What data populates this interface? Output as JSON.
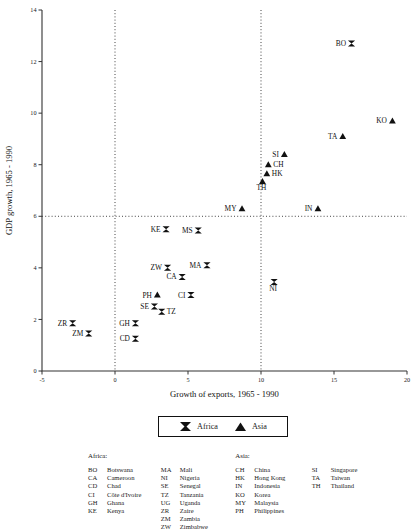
{
  "chart_data": {
    "type": "scatter",
    "title": "",
    "xlabel": "Growth of exports, 1965 - 1990",
    "ylabel": "GDP growth, 1965 - 1990",
    "xlim": [
      -5,
      20
    ],
    "ylim": [
      0,
      14
    ],
    "xticks": [
      -5,
      0,
      5,
      10,
      15,
      20
    ],
    "yticks": [
      0,
      2,
      4,
      6,
      8,
      10,
      12,
      14
    ],
    "grid": false,
    "reference_lines": {
      "vertical": [
        0,
        10
      ],
      "horizontal": [
        6
      ]
    },
    "legend_position": "below-axes",
    "series": [
      {
        "name": "Africa",
        "marker": "bowtie",
        "color": "#111111",
        "points": [
          {
            "code": "BO",
            "label": "Botswana",
            "x": 16.2,
            "y": 12.7,
            "label_side": "left"
          },
          {
            "code": "NI",
            "label": "Nigeria",
            "x": 10.9,
            "y": 3.45,
            "label_side": "below"
          },
          {
            "code": "MS",
            "label": "Mali",
            "x": 5.7,
            "y": 5.45,
            "label_side": "left"
          },
          {
            "code": "KE",
            "label": "Kenya",
            "x": 3.5,
            "y": 5.5,
            "label_side": "left"
          },
          {
            "code": "MA",
            "label": "Mali",
            "x": 6.3,
            "y": 4.1,
            "label_side": "left"
          },
          {
            "code": "ZW",
            "label": "Zimbabwe",
            "x": 3.6,
            "y": 4.0,
            "label_side": "left"
          },
          {
            "code": "CA",
            "label": "Cameroon",
            "x": 4.6,
            "y": 3.65,
            "label_side": "left"
          },
          {
            "code": "CI",
            "label": "Côte d'Ivoire",
            "x": 5.2,
            "y": 2.95,
            "label_side": "left"
          },
          {
            "code": "SE",
            "label": "Senegal",
            "x": 2.7,
            "y": 2.5,
            "label_side": "left"
          },
          {
            "code": "TZ",
            "label": "Tanzania",
            "x": 3.2,
            "y": 2.3,
            "label_side": "right"
          },
          {
            "code": "GH",
            "label": "Ghana",
            "x": 1.4,
            "y": 1.85,
            "label_side": "left"
          },
          {
            "code": "ZR",
            "label": "Zaire",
            "x": -2.9,
            "y": 1.85,
            "label_side": "left"
          },
          {
            "code": "ZM",
            "label": "Zambia",
            "x": -1.8,
            "y": 1.45,
            "label_side": "left"
          },
          {
            "code": "CD",
            "label": "Chad",
            "x": 1.4,
            "y": 1.25,
            "label_side": "left"
          }
        ]
      },
      {
        "name": "Asia",
        "marker": "triangle",
        "color": "#111111",
        "points": [
          {
            "code": "KO",
            "label": "Korea",
            "x": 19.0,
            "y": 9.7,
            "label_side": "left"
          },
          {
            "code": "TA",
            "label": "Taiwan",
            "x": 15.6,
            "y": 9.1,
            "label_side": "left"
          },
          {
            "code": "SI",
            "label": "Singapore",
            "x": 11.6,
            "y": 8.4,
            "label_side": "left"
          },
          {
            "code": "CH",
            "label": "China",
            "x": 10.5,
            "y": 8.0,
            "label_side": "right"
          },
          {
            "code": "HK",
            "label": "Hong Kong",
            "x": 10.4,
            "y": 7.65,
            "label_side": "right"
          },
          {
            "code": "TH",
            "label": "Thailand",
            "x": 10.1,
            "y": 7.35,
            "label_side": "below"
          },
          {
            "code": "IN",
            "label": "Indonesia",
            "x": 13.9,
            "y": 6.3,
            "label_side": "left"
          },
          {
            "code": "MY",
            "label": "Malaysia",
            "x": 8.7,
            "y": 6.3,
            "label_side": "left"
          },
          {
            "code": "PH",
            "label": "Philippines",
            "x": 2.9,
            "y": 2.95,
            "label_side": "left"
          }
        ]
      }
    ]
  },
  "legend": {
    "africa_label": "Africa",
    "asia_label": "Asia",
    "africa_marker": "bowtie-marker",
    "asia_marker": "triangle-marker"
  },
  "key": {
    "africa_heading": "Africa:",
    "asia_heading": "Asia:",
    "columns": [
      {
        "heading": "Africa:",
        "entries": [
          {
            "code": "BO",
            "name": "Botswana"
          },
          {
            "code": "CA",
            "name": "Cameroon"
          },
          {
            "code": "CD",
            "name": "Chad"
          },
          {
            "code": "CI",
            "name": "Côte d'Ivoire"
          },
          {
            "code": "GH",
            "name": "Ghana"
          },
          {
            "code": "KE",
            "name": "Kenya"
          }
        ]
      },
      {
        "heading": "",
        "entries": [
          {
            "code": "MA",
            "name": "Mali"
          },
          {
            "code": "NI",
            "name": "Nigeria"
          },
          {
            "code": "SE",
            "name": "Senegal"
          },
          {
            "code": "TZ",
            "name": "Tanzania"
          },
          {
            "code": "UG",
            "name": "Uganda"
          },
          {
            "code": "ZR",
            "name": "Zaire"
          },
          {
            "code": "ZM",
            "name": "Zambia"
          },
          {
            "code": "ZW",
            "name": "Zimbabwe"
          }
        ]
      },
      {
        "heading": "Asia:",
        "entries": [
          {
            "code": "CH",
            "name": "China"
          },
          {
            "code": "HK",
            "name": "Hong Kong"
          },
          {
            "code": "IN",
            "name": "Indonesia"
          },
          {
            "code": "KO",
            "name": "Korea"
          },
          {
            "code": "MY",
            "name": "Malaysia"
          },
          {
            "code": "PH",
            "name": "Philippines"
          }
        ]
      },
      {
        "heading": "",
        "entries": [
          {
            "code": "SI",
            "name": "Singapore"
          },
          {
            "code": "TA",
            "name": "Taiwan"
          },
          {
            "code": "TH",
            "name": "Thailand"
          }
        ]
      }
    ]
  }
}
